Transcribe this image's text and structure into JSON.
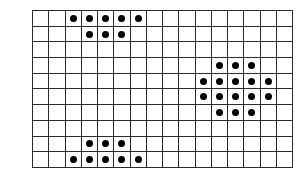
{
  "figure": {
    "type": "dot-grid-pattern",
    "background_color": "#ffffff",
    "grid_line_color": "#2b2b2b",
    "dot_color": "#000000",
    "columns": 16,
    "rows": 10,
    "cell_width_px": 16.3,
    "cell_height_px": 15.8,
    "grid_left_px": 32,
    "grid_top_px": 10,
    "grid_width_px": 261,
    "grid_height_px": 158
  },
  "clusters": [
    {
      "name": "top-left-cluster",
      "dot_count": 8,
      "rows": [
        {
          "row": 0,
          "columns": [
            2,
            3,
            4,
            5,
            6
          ]
        },
        {
          "row": 1,
          "columns": [
            3,
            4,
            5
          ]
        }
      ]
    },
    {
      "name": "right-cluster",
      "dot_count": 16,
      "rows": [
        {
          "row": 3,
          "columns": [
            11,
            12,
            13
          ]
        },
        {
          "row": 4,
          "columns": [
            10,
            11,
            12,
            13,
            14
          ]
        },
        {
          "row": 5,
          "columns": [
            10,
            11,
            12,
            13,
            14
          ]
        },
        {
          "row": 6,
          "columns": [
            11,
            12,
            13
          ]
        }
      ]
    },
    {
      "name": "bottom-left-cluster",
      "dot_count": 8,
      "rows": [
        {
          "row": 8,
          "columns": [
            3,
            4,
            5
          ]
        },
        {
          "row": 9,
          "columns": [
            2,
            3,
            4,
            5,
            6
          ]
        }
      ]
    }
  ],
  "dots": [
    [
      2,
      0
    ],
    [
      3,
      0
    ],
    [
      4,
      0
    ],
    [
      5,
      0
    ],
    [
      6,
      0
    ],
    [
      3,
      1
    ],
    [
      4,
      1
    ],
    [
      5,
      1
    ],
    [
      11,
      3
    ],
    [
      12,
      3
    ],
    [
      13,
      3
    ],
    [
      10,
      4
    ],
    [
      11,
      4
    ],
    [
      12,
      4
    ],
    [
      13,
      4
    ],
    [
      14,
      4
    ],
    [
      10,
      5
    ],
    [
      11,
      5
    ],
    [
      12,
      5
    ],
    [
      13,
      5
    ],
    [
      14,
      5
    ],
    [
      11,
      6
    ],
    [
      12,
      6
    ],
    [
      13,
      6
    ],
    [
      3,
      8
    ],
    [
      4,
      8
    ],
    [
      5,
      8
    ],
    [
      2,
      9
    ],
    [
      3,
      9
    ],
    [
      4,
      9
    ],
    [
      5,
      9
    ],
    [
      6,
      9
    ]
  ],
  "total_dots": 32
}
